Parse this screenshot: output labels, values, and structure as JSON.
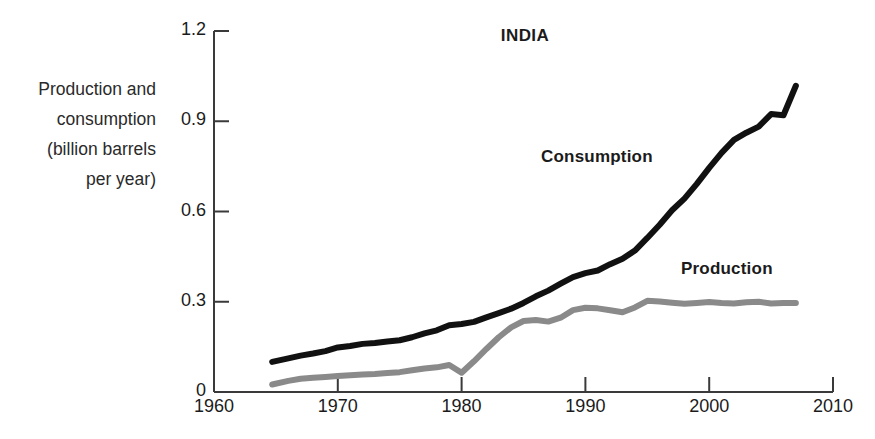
{
  "chart_data": {
    "type": "line",
    "title": "INDIA",
    "xlabel": "",
    "ylabel": "Production and\nconsumption\n(billion barrels\nper year)",
    "ylabel_lines": [
      "Production and",
      "consumption",
      "(billion barrels",
      "per year)"
    ],
    "xlim": [
      1960,
      2010
    ],
    "ylim": [
      0,
      1.2
    ],
    "xticks": [
      1960,
      1970,
      1980,
      1990,
      2000,
      2010
    ],
    "xtick_labels": [
      "1960",
      "1970",
      "1980",
      "1990",
      "2000",
      "2010"
    ],
    "yticks": [
      0,
      0.3,
      0.6,
      0.9,
      1.2
    ],
    "ytick_labels": [
      "0",
      "0.3",
      "0.6",
      "0.9",
      "1.2"
    ],
    "grid": false,
    "legend_position": "inline-annotations",
    "annotations": [
      {
        "text": "Consumption",
        "x": 1986.5,
        "y": 0.8,
        "color": "#111111"
      },
      {
        "text": "Production",
        "x": 1997.8,
        "y": 0.44,
        "color": "#111111"
      }
    ],
    "series": [
      {
        "name": "Consumption",
        "color": "#111111",
        "x": [
          1964.7,
          1966,
          1967,
          1968,
          1969,
          1970,
          1971,
          1972,
          1973,
          1974,
          1975,
          1976,
          1977,
          1978,
          1979,
          1980,
          1981,
          1982,
          1983,
          1984,
          1985,
          1986,
          1987,
          1988,
          1989,
          1990,
          1991,
          1992,
          1993,
          1994,
          1995,
          1996,
          1997,
          1998,
          1999,
          2000,
          2001,
          2002,
          2003,
          2004,
          2005,
          2006,
          2007
        ],
        "values": [
          0.1,
          0.112,
          0.121,
          0.128,
          0.136,
          0.148,
          0.153,
          0.16,
          0.163,
          0.168,
          0.172,
          0.182,
          0.195,
          0.205,
          0.222,
          0.226,
          0.233,
          0.248,
          0.262,
          0.277,
          0.296,
          0.318,
          0.337,
          0.36,
          0.382,
          0.395,
          0.404,
          0.425,
          0.443,
          0.47,
          0.512,
          0.556,
          0.604,
          0.643,
          0.692,
          0.745,
          0.795,
          0.838,
          0.862,
          0.882,
          0.924,
          0.92,
          1.018
        ]
      },
      {
        "name": "Production",
        "color": "#8a8a8a",
        "x": [
          1964.7,
          1966,
          1967,
          1968,
          1969,
          1970,
          1971,
          1972,
          1973,
          1974,
          1975,
          1976,
          1977,
          1978,
          1979,
          1980,
          1981,
          1982,
          1983,
          1984,
          1985,
          1986,
          1987,
          1988,
          1989,
          1990,
          1991,
          1992,
          1993,
          1994,
          1995,
          1996,
          1997,
          1998,
          1999,
          2000,
          2001,
          2002,
          2003,
          2004,
          2005,
          2006,
          2007
        ],
        "values": [
          0.025,
          0.037,
          0.044,
          0.047,
          0.05,
          0.053,
          0.056,
          0.058,
          0.06,
          0.063,
          0.066,
          0.072,
          0.078,
          0.082,
          0.09,
          0.064,
          0.102,
          0.143,
          0.182,
          0.215,
          0.236,
          0.239,
          0.234,
          0.247,
          0.272,
          0.28,
          0.278,
          0.272,
          0.265,
          0.281,
          0.303,
          0.301,
          0.297,
          0.293,
          0.296,
          0.299,
          0.296,
          0.294,
          0.298,
          0.3,
          0.294,
          0.296,
          0.296
        ]
      }
    ]
  },
  "axes": {
    "y_axis_title_lines": [
      "Production and",
      "consumption",
      "(billion barrels",
      "per year)"
    ]
  }
}
